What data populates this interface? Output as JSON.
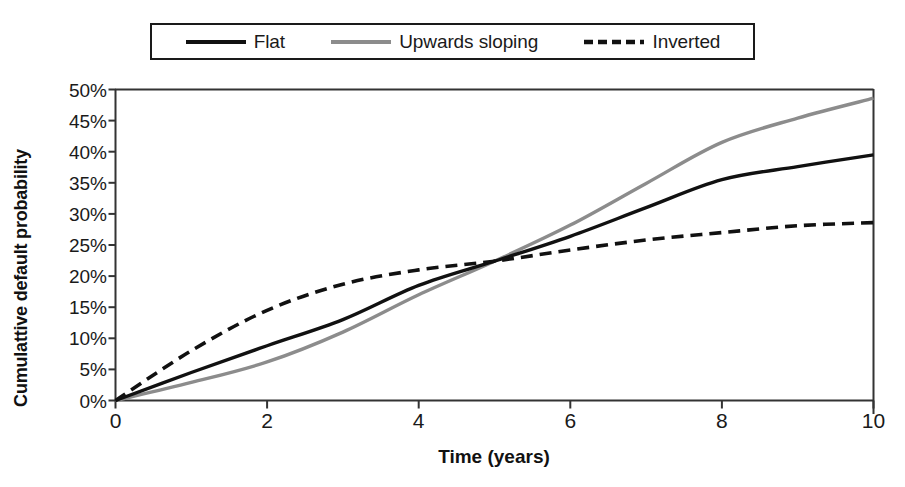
{
  "chart_data": {
    "type": "line",
    "title": "",
    "xlabel": "Time (years)",
    "ylabel": "Cumulattive default probability",
    "xlim": [
      0,
      10
    ],
    "ylim": [
      0,
      0.5
    ],
    "grid": false,
    "legend_position": "top",
    "x_ticks": [
      "0",
      "2",
      "4",
      "6",
      "8",
      "10"
    ],
    "x_tick_values": [
      0,
      2,
      4,
      6,
      8,
      10
    ],
    "y_ticks": [
      "0%",
      "5%",
      "10%",
      "15%",
      "20%",
      "25%",
      "30%",
      "35%",
      "40%",
      "45%",
      "50%"
    ],
    "y_tick_values": [
      0,
      5,
      10,
      15,
      20,
      25,
      30,
      35,
      40,
      45,
      50
    ],
    "x": [
      0,
      1,
      2,
      3,
      4,
      5,
      6,
      7,
      8,
      9,
      10
    ],
    "series": [
      {
        "name": "Flat",
        "color": "#111111",
        "style": "solid",
        "width": 3.4,
        "values": [
          0,
          4.5,
          8.8,
          13.0,
          18.5,
          22.4,
          26.4,
          31.0,
          35.5,
          37.6,
          39.5
        ]
      },
      {
        "name": "Upwards sloping",
        "color": "#8c8c8c",
        "style": "solid",
        "width": 3.4,
        "values": [
          0,
          2.9,
          6.2,
          11.0,
          17.0,
          22.4,
          28.2,
          34.9,
          41.5,
          45.4,
          48.6
        ]
      },
      {
        "name": "Inverted",
        "color": "#111111",
        "style": "dashed",
        "width": 3.6,
        "values": [
          0,
          8.0,
          14.5,
          18.7,
          21.0,
          22.4,
          24.2,
          25.8,
          27.0,
          28.1,
          28.6
        ]
      }
    ]
  },
  "legend": {
    "entries": [
      {
        "label": "Flat",
        "swatch": "solid-black-line-swatch"
      },
      {
        "label": "Upwards sloping",
        "swatch": "solid-gray-line-swatch"
      },
      {
        "label": "Inverted",
        "swatch": "dashed-black-line-swatch"
      }
    ]
  },
  "axes": {
    "x_title": "Time (years)",
    "y_title": "Cumulattive default probability"
  },
  "colors": {
    "axis": "#333333",
    "flat": "#111111",
    "upwards_sloping": "#8c8c8c",
    "inverted": "#111111",
    "background": "#ffffff"
  }
}
